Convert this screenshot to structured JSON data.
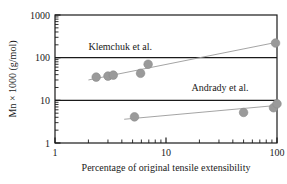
{
  "chart_data": {
    "type": "scatter",
    "title": "",
    "xlabel": "Percentage of original tensile extensibility",
    "ylabel": "Mn × 1000 (g/mol)",
    "xscale": "log",
    "yscale": "log",
    "xlim": [
      1,
      100
    ],
    "ylim": [
      1,
      1000
    ],
    "xticks": [
      1,
      10,
      100
    ],
    "xtick_labels": [
      "1",
      "10",
      "100"
    ],
    "yticks": [
      1,
      10,
      100,
      1000
    ],
    "ytick_labels": [
      "1",
      "10",
      "100",
      "1000"
    ],
    "grid": "horizontal-major-only",
    "gridlines_y": [
      10,
      100
    ],
    "minor_ticks": true,
    "legend_position": "inline-annotations",
    "marker_color": "#9a9a9a",
    "marker_edge_color": "#8c8c8c",
    "trendline_color": "#9a9a9a",
    "axis_color": "#1a1a1a",
    "series": [
      {
        "name": "Klemchuk et al.",
        "annotation": "Klemchuk et al.",
        "annotation_x": 2.0,
        "annotation_y": 150,
        "points": [
          {
            "x": 2.35,
            "y": 35
          },
          {
            "x": 3.0,
            "y": 37
          },
          {
            "x": 3.35,
            "y": 39
          },
          {
            "x": 5.9,
            "y": 43
          },
          {
            "x": 6.9,
            "y": 70
          },
          {
            "x": 97,
            "y": 220
          }
        ],
        "trendline": {
          "x1": 2.0,
          "y1": 30,
          "x2": 100,
          "y2": 230
        }
      },
      {
        "name": "Andrady et al.",
        "annotation": "Andrady et al.",
        "annotation_x": 17,
        "annotation_y": 17,
        "points": [
          {
            "x": 5.2,
            "y": 4.1
          },
          {
            "x": 50,
            "y": 5.2
          },
          {
            "x": 93,
            "y": 6.7
          },
          {
            "x": 100,
            "y": 8.3
          }
        ],
        "trendline": {
          "x1": 4.2,
          "y1": 3.6,
          "x2": 100,
          "y2": 7.6
        }
      }
    ]
  }
}
